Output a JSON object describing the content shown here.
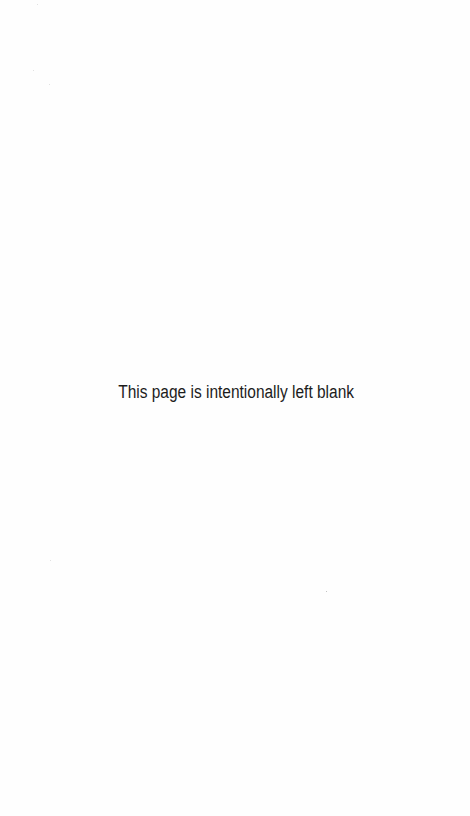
{
  "page": {
    "notice": "This page is intentionally left blank",
    "background_color": "#fefefe",
    "text_color": "#1c1c1c"
  }
}
